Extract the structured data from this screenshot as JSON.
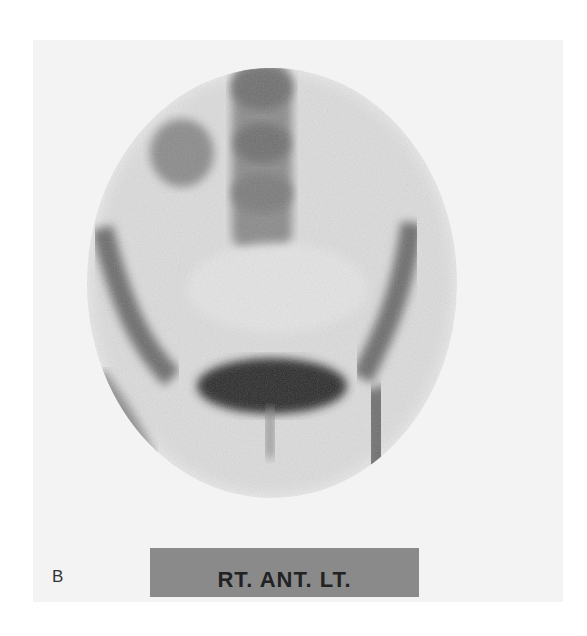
{
  "figure": {
    "panel_label": "B",
    "orientation_label": "RT. ANT. LT.",
    "image_description": "Grayscale nuclear medicine bone scan of the pelvis, anterior view, with intense bladder activity",
    "colors": {
      "background": "#ffffff",
      "panel_background": "#f3f3f3",
      "label_bar": "#8a8a8a",
      "label_text": "#222222",
      "uptake_dark": "#2a2a2a"
    }
  }
}
